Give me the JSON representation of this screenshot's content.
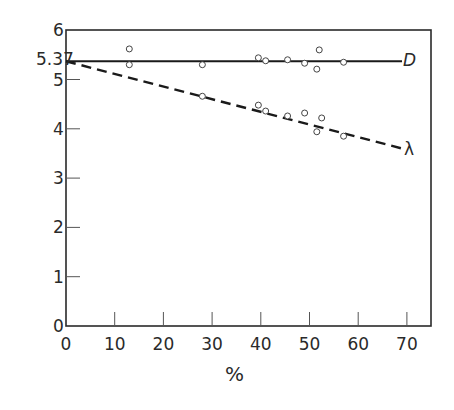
{
  "chart_data": {
    "type": "scatter",
    "title": "",
    "xlabel": "%",
    "ylabel": "",
    "xlim": [
      0,
      75
    ],
    "ylim": [
      0,
      6
    ],
    "x_ticks": [
      0,
      10,
      20,
      30,
      40,
      50,
      60,
      70
    ],
    "y_ticks": [
      0,
      1,
      2,
      3,
      4,
      5,
      6
    ],
    "y_extra_tick": {
      "value": 5.37,
      "label": "5.37"
    },
    "grid": false,
    "legend": "inline labels at line ends",
    "series": [
      {
        "name": "D",
        "style": "solid line with open circles",
        "fit_line": {
          "x": [
            0,
            69
          ],
          "y": [
            5.37,
            5.37
          ]
        },
        "points": [
          {
            "x": 13,
            "y": 5.62
          },
          {
            "x": 13,
            "y": 5.3
          },
          {
            "x": 28,
            "y": 5.3
          },
          {
            "x": 39.5,
            "y": 5.44
          },
          {
            "x": 41,
            "y": 5.38
          },
          {
            "x": 45.5,
            "y": 5.4
          },
          {
            "x": 49,
            "y": 5.33
          },
          {
            "x": 52,
            "y": 5.6
          },
          {
            "x": 51.5,
            "y": 5.21
          },
          {
            "x": 57,
            "y": 5.35
          }
        ]
      },
      {
        "name": "λ",
        "style": "dashed line with open circles",
        "fit_line": {
          "x": [
            0,
            69
          ],
          "y": [
            5.37,
            3.6
          ]
        },
        "points": [
          {
            "x": 28,
            "y": 4.66
          },
          {
            "x": 39.5,
            "y": 4.48
          },
          {
            "x": 41,
            "y": 4.36
          },
          {
            "x": 45.5,
            "y": 4.26
          },
          {
            "x": 49,
            "y": 4.32
          },
          {
            "x": 52.5,
            "y": 4.22
          },
          {
            "x": 51.5,
            "y": 3.94
          },
          {
            "x": 57,
            "y": 3.85
          }
        ]
      }
    ]
  },
  "labels": {
    "x_axis_title": "%",
    "y_special": "5.37",
    "series_d": "D",
    "series_lambda": "λ",
    "x_ticks": [
      "0",
      "10",
      "20",
      "30",
      "40",
      "50",
      "60",
      "70"
    ],
    "y_ticks": [
      "0",
      "1",
      "2",
      "3",
      "4",
      "5",
      "6"
    ]
  }
}
